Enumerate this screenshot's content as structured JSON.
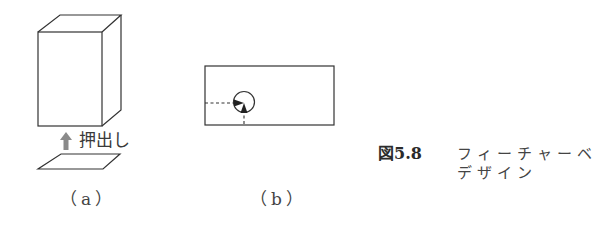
{
  "figure": {
    "number": "図5.8",
    "caption_line1": "フィーチャーベ",
    "caption_line2": "デザイン"
  },
  "panel_a": {
    "label": "（a）",
    "extrude_label": "押出し",
    "icons": {
      "box": "extruded-box-icon",
      "arrow": "up-arrow-icon",
      "sketch": "parallelogram-sketch-icon"
    }
  },
  "panel_b": {
    "label": "（b）",
    "icons": {
      "rectangle": "plate-rectangle-icon",
      "hole": "hole-circle-icon",
      "dimensions": "dashed-dimension-lines-icon"
    }
  },
  "colors": {
    "line": "#333333",
    "arrow": "#8a8a8a",
    "background": "#ffffff"
  }
}
